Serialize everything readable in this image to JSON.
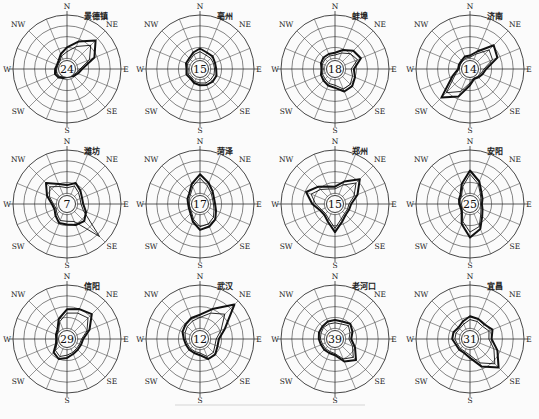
{
  "chart_data": {
    "type": "wind_rose_grid",
    "title": "",
    "directions": [
      "N",
      "NNE",
      "NE",
      "ENE",
      "E",
      "ESE",
      "SE",
      "SSE",
      "S",
      "SSW",
      "SW",
      "WSW",
      "W",
      "WNW",
      "NW",
      "NNW"
    ],
    "direction_labels": [
      "N",
      "NE",
      "E",
      "SE",
      "S",
      "SW",
      "W",
      "NW"
    ],
    "rings": 5,
    "grid": true,
    "center_value_meaning": "calm frequency (%)",
    "stations": [
      {
        "name": "景德镇",
        "calm": 24,
        "series": [
          {
            "name": "outer",
            "values": [
              0.4,
              0.55,
              0.75,
              0.55,
              0.28,
              0.22,
              0.18,
              0.15,
              0.15,
              0.18,
              0.22,
              0.24,
              0.22,
              0.2,
              0.22,
              0.3
            ]
          },
          {
            "name": "inner",
            "values": [
              0.32,
              0.45,
              0.62,
              0.45,
              0.24,
              0.19,
              0.16,
              0.14,
              0.14,
              0.16,
              0.19,
              0.21,
              0.19,
              0.18,
              0.19,
              0.26
            ]
          }
        ]
      },
      {
        "name": "亳州",
        "calm": 15,
        "series": [
          {
            "name": "outer",
            "values": [
              0.38,
              0.33,
              0.33,
              0.3,
              0.3,
              0.33,
              0.33,
              0.32,
              0.3,
              0.28,
              0.25,
              0.27,
              0.25,
              0.28,
              0.28,
              0.33
            ]
          },
          {
            "name": "inner",
            "values": [
              0.32,
              0.28,
              0.28,
              0.27,
              0.27,
              0.28,
              0.28,
              0.28,
              0.26,
              0.25,
              0.22,
              0.24,
              0.22,
              0.25,
              0.25,
              0.29
            ]
          }
        ]
      },
      {
        "name": "蚌埠",
        "calm": 18,
        "series": [
          {
            "name": "outer",
            "values": [
              0.3,
              0.38,
              0.48,
              0.52,
              0.35,
              0.4,
              0.45,
              0.45,
              0.35,
              0.33,
              0.3,
              0.28,
              0.25,
              0.28,
              0.3,
              0.3
            ]
          },
          {
            "name": "inner",
            "values": [
              0.26,
              0.32,
              0.4,
              0.45,
              0.3,
              0.35,
              0.4,
              0.4,
              0.3,
              0.29,
              0.26,
              0.25,
              0.22,
              0.25,
              0.26,
              0.26
            ]
          }
        ]
      },
      {
        "name": "济南",
        "calm": 14,
        "series": [
          {
            "name": "outer",
            "values": [
              0.25,
              0.35,
              0.62,
              0.55,
              0.3,
              0.25,
              0.22,
              0.2,
              0.3,
              0.55,
              0.75,
              0.35,
              0.22,
              0.22,
              0.22,
              0.25
            ]
          },
          {
            "name": "inner",
            "values": [
              0.22,
              0.3,
              0.5,
              0.45,
              0.26,
              0.22,
              0.2,
              0.18,
              0.26,
              0.45,
              0.62,
              0.3,
              0.2,
              0.2,
              0.2,
              0.22
            ]
          }
        ]
      },
      {
        "name": "潍坊",
        "calm": 7,
        "series": [
          {
            "name": "outer",
            "values": [
              0.35,
              0.42,
              0.35,
              0.3,
              0.3,
              0.38,
              0.45,
              0.42,
              0.38,
              0.38,
              0.3,
              0.25,
              0.28,
              0.4,
              0.55,
              0.4
            ]
          },
          {
            "name": "inner",
            "values": [
              0.3,
              0.36,
              0.3,
              0.26,
              0.26,
              0.33,
              0.85,
              0.35,
              0.32,
              0.33,
              0.26,
              0.22,
              0.25,
              0.35,
              0.45,
              0.35
            ]
          }
        ]
      },
      {
        "name": "菏泽",
        "calm": 17,
        "series": [
          {
            "name": "outer",
            "values": [
              0.55,
              0.42,
              0.33,
              0.28,
              0.28,
              0.32,
              0.4,
              0.45,
              0.48,
              0.35,
              0.25,
              0.22,
              0.22,
              0.25,
              0.28,
              0.4
            ]
          },
          {
            "name": "inner",
            "values": [
              0.48,
              0.36,
              0.29,
              0.25,
              0.25,
              0.28,
              0.35,
              0.4,
              0.42,
              0.31,
              0.22,
              0.2,
              0.2,
              0.22,
              0.25,
              0.35
            ]
          }
        ]
      },
      {
        "name": "郑州",
        "calm": 15,
        "series": [
          {
            "name": "outer",
            "values": [
              0.32,
              0.45,
              0.65,
              0.45,
              0.3,
              0.28,
              0.28,
              0.35,
              0.52,
              0.35,
              0.28,
              0.3,
              0.42,
              0.58,
              0.45,
              0.35
            ]
          },
          {
            "name": "inner",
            "values": [
              0.28,
              0.38,
              0.55,
              0.38,
              0.26,
              0.25,
              0.25,
              0.3,
              0.45,
              0.3,
              0.25,
              0.27,
              0.36,
              0.48,
              0.38,
              0.3
            ]
          }
        ]
      },
      {
        "name": "安阳",
        "calm": 25,
        "series": [
          {
            "name": "outer",
            "values": [
              0.62,
              0.45,
              0.3,
              0.25,
              0.22,
              0.25,
              0.32,
              0.5,
              0.62,
              0.4,
              0.22,
              0.18,
              0.2,
              0.22,
              0.25,
              0.4
            ]
          },
          {
            "name": "inner",
            "values": [
              0.55,
              0.4,
              0.27,
              0.22,
              0.2,
              0.22,
              0.28,
              0.45,
              0.52,
              0.35,
              0.2,
              0.16,
              0.18,
              0.2,
              0.22,
              0.35
            ]
          }
        ]
      },
      {
        "name": "信阳",
        "calm": 29,
        "series": [
          {
            "name": "outer",
            "values": [
              0.55,
              0.6,
              0.65,
              0.45,
              0.3,
              0.28,
              0.28,
              0.3,
              0.35,
              0.4,
              0.35,
              0.22,
              0.2,
              0.22,
              0.25,
              0.4
            ]
          },
          {
            "name": "inner",
            "values": [
              0.48,
              0.52,
              0.55,
              0.4,
              0.27,
              0.25,
              0.25,
              0.27,
              0.3,
              0.35,
              0.3,
              0.2,
              0.18,
              0.2,
              0.22,
              0.35
            ]
          }
        ]
      },
      {
        "name": "武汉",
        "calm": 12,
        "series": [
          {
            "name": "outer",
            "values": [
              0.45,
              0.6,
              0.9,
              0.5,
              0.35,
              0.35,
              0.4,
              0.4,
              0.3,
              0.28,
              0.28,
              0.28,
              0.3,
              0.35,
              0.38,
              0.42
            ]
          },
          {
            "name": "inner",
            "values": [
              0.4,
              0.52,
              0.65,
              0.42,
              0.3,
              0.3,
              0.35,
              0.35,
              0.26,
              0.25,
              0.25,
              0.25,
              0.27,
              0.3,
              0.33,
              0.36
            ]
          }
        ]
      },
      {
        "name": "老河口",
        "calm": 39,
        "series": [
          {
            "name": "outer",
            "values": [
              0.35,
              0.35,
              0.4,
              0.35,
              0.3,
              0.4,
              0.55,
              0.45,
              0.3,
              0.28,
              0.28,
              0.28,
              0.3,
              0.32,
              0.33,
              0.35
            ]
          },
          {
            "name": "inner",
            "values": [
              0.3,
              0.3,
              0.35,
              0.3,
              0.26,
              0.35,
              0.48,
              0.4,
              0.27,
              0.25,
              0.25,
              0.25,
              0.27,
              0.28,
              0.3,
              0.3
            ]
          }
        ]
      },
      {
        "name": "宜昌",
        "calm": 31,
        "series": [
          {
            "name": "outer",
            "values": [
              0.42,
              0.4,
              0.38,
              0.45,
              0.4,
              0.55,
              0.75,
              0.55,
              0.35,
              0.28,
              0.28,
              0.28,
              0.33,
              0.33,
              0.3,
              0.35
            ]
          },
          {
            "name": "inner",
            "values": [
              0.36,
              0.35,
              0.33,
              0.38,
              0.35,
              0.48,
              0.65,
              0.48,
              0.3,
              0.25,
              0.25,
              0.25,
              0.28,
              0.28,
              0.27,
              0.3
            ]
          }
        ]
      }
    ]
  },
  "labels": {
    "stations": [
      "景德镇",
      "亳州",
      "蚌埠",
      "济南",
      "潍坊",
      "菏泽",
      "郑州",
      "安阳",
      "信阳",
      "武汉",
      "老河口",
      "宜昌"
    ],
    "calms": [
      "24",
      "15",
      "18",
      "14",
      "7",
      "17",
      "15",
      "25",
      "29",
      "12",
      "39",
      "31"
    ]
  }
}
